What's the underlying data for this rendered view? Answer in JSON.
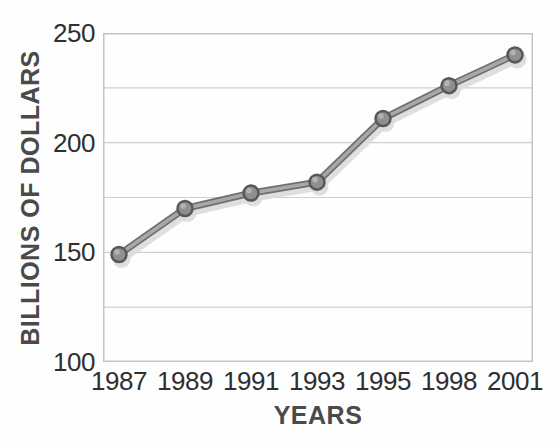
{
  "chart_data": {
    "type": "line",
    "title": "",
    "xlabel": "YEARS",
    "ylabel": "BILLIONS OF DOLLARS",
    "categories": [
      "1987",
      "1989",
      "1991",
      "1993",
      "1995",
      "1998",
      "2001"
    ],
    "values": [
      149,
      170,
      177,
      182,
      211,
      226,
      240
    ],
    "ylim": [
      100,
      250
    ],
    "yticks": [
      100,
      150,
      200,
      250
    ],
    "gridline_step": 25,
    "grid": true,
    "legend": false,
    "colors": {
      "line_outer": "#6f6f6f",
      "line_inner": "#a8a8a8",
      "line_shadow": "#dcdcdc",
      "marker_fill": "#8f8f8f",
      "marker_stroke": "#585858",
      "marker_highlight": "#b8b8b8",
      "gridline": "#cfcfcf",
      "plot_border": "#c4c4c4",
      "tick_text": "#2f2f2f",
      "axis_title_text": "#4a4a4a"
    }
  }
}
